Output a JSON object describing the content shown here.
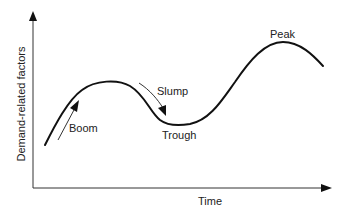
{
  "diagram": {
    "axes": {
      "x_label": "Time",
      "y_label": "Demand-related factors"
    },
    "labels": {
      "boom": "Boom",
      "slump": "Slump",
      "trough": "Trough",
      "peak": "Peak"
    },
    "colors": {
      "line": "#111111",
      "axis": "#333333",
      "text": "#222222",
      "background": "#ffffff"
    }
  }
}
